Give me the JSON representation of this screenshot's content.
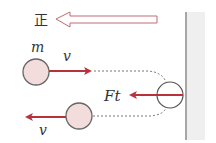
{
  "diagram": {
    "positive_direction_label": "正",
    "mass_label": "m",
    "incoming_velocity_label": "v",
    "outgoing_velocity_label": "v",
    "impulse_label": "Ft",
    "colors": {
      "arrow_red": "#b8323c",
      "ball_fill": "#f3dcdc",
      "ball_stroke": "#666666",
      "wall": "#888888",
      "wall_shade": "#eeeeee",
      "hollow_arrow_stroke": "#c26a72"
    }
  }
}
